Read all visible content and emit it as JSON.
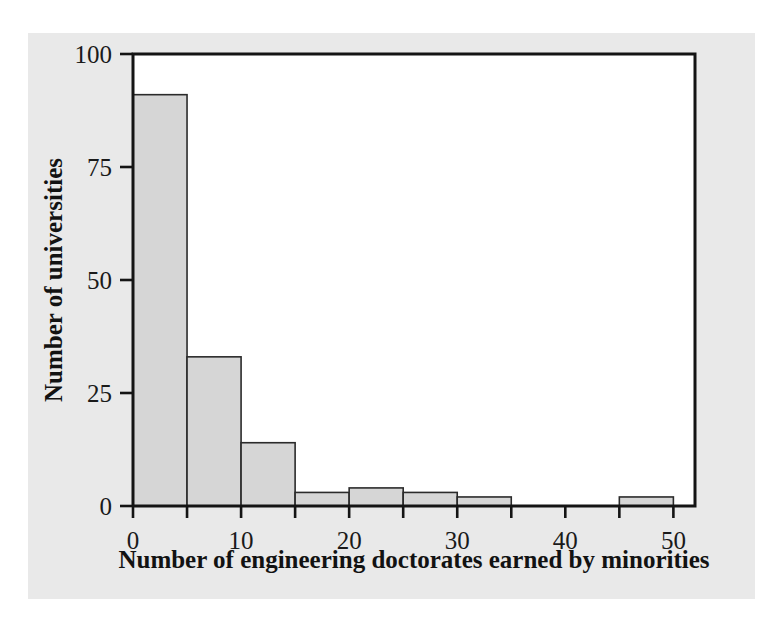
{
  "figure": {
    "background_color": "#e9e9e9",
    "page_background_color": "#ffffff",
    "frame_color": "#141414",
    "bar_fill_color": "#d6d6d6",
    "bar_edge_color": "#2b2b2b",
    "text_color": "#121212"
  },
  "chart_data": {
    "type": "bar",
    "chart_subtype": "histogram",
    "title": "",
    "xlabel": "Number of engineering doctorates earned by minorities",
    "ylabel": "Number of universities",
    "xlim": [
      0,
      52
    ],
    "ylim": [
      0,
      100
    ],
    "grid": false,
    "legend": false,
    "bin_width": 5,
    "bin_edges": [
      0,
      5,
      10,
      15,
      20,
      25,
      30,
      35,
      40,
      45,
      50
    ],
    "categories": [
      "0-5",
      "5-10",
      "10-15",
      "15-20",
      "20-25",
      "25-30",
      "30-35",
      "35-40",
      "40-45",
      "45-50"
    ],
    "values": [
      91,
      33,
      14,
      3,
      4,
      3,
      2,
      0,
      0,
      2
    ],
    "bars": [
      {
        "x0": 0,
        "x1": 5,
        "count": 91
      },
      {
        "x0": 5,
        "x1": 10,
        "count": 33
      },
      {
        "x0": 10,
        "x1": 15,
        "count": 14
      },
      {
        "x0": 15,
        "x1": 20,
        "count": 3
      },
      {
        "x0": 20,
        "x1": 25,
        "count": 4
      },
      {
        "x0": 25,
        "x1": 30,
        "count": 3
      },
      {
        "x0": 30,
        "x1": 35,
        "count": 2
      },
      {
        "x0": 35,
        "x1": 40,
        "count": 0
      },
      {
        "x0": 40,
        "x1": 45,
        "count": 0
      },
      {
        "x0": 45,
        "x1": 50,
        "count": 2
      }
    ],
    "xticks": [
      0,
      10,
      20,
      30,
      40,
      50
    ],
    "xtick_labels": [
      "0",
      "10",
      "20",
      "30",
      "40",
      "50"
    ],
    "xminorticks": [
      5,
      15,
      25,
      35,
      45
    ],
    "yticks": [
      0,
      25,
      50,
      75,
      100
    ],
    "ytick_labels": [
      "0",
      "25",
      "50",
      "75",
      "100"
    ]
  }
}
